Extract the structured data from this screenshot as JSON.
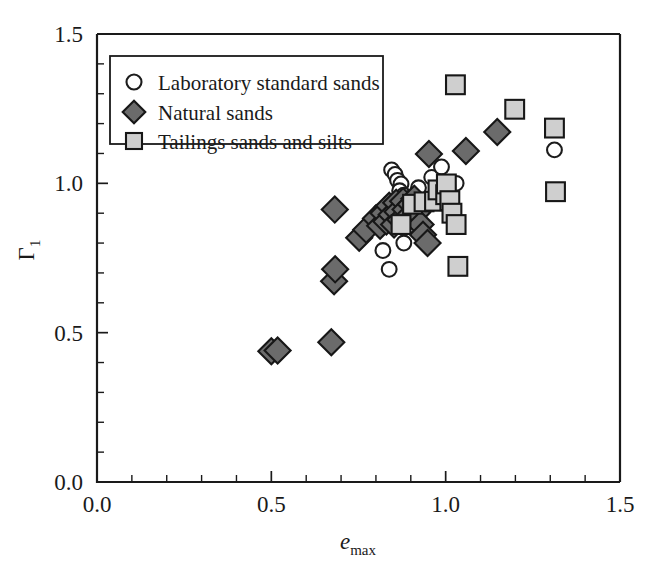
{
  "chart_data": {
    "type": "scatter",
    "title": "",
    "xlabel": "e_max",
    "xlabel_base": "e",
    "xlabel_sub": "max",
    "ylabel": "Γ₁",
    "ylabel_base": "Γ",
    "ylabel_sub": "1",
    "xlim": [
      0.0,
      1.5
    ],
    "ylim": [
      0.0,
      1.5
    ],
    "xticks": [
      "0.0",
      "0.5",
      "1.0",
      "1.5"
    ],
    "xtick_values": [
      0.0,
      0.5,
      1.0,
      1.5
    ],
    "yticks": [
      "0.0",
      "0.5",
      "1.0",
      "1.5"
    ],
    "ytick_values": [
      0.0,
      0.5,
      1.0,
      1.5
    ],
    "minor_tick_step": 0.1,
    "grid": false,
    "legend_position": "upper-left-inside",
    "series": [
      {
        "name": "Laboratory standard sands",
        "marker": "circle",
        "marker_fill": "#ffffff",
        "marker_edge": "#1c1c1c",
        "points": [
          [
            0.845,
            1.045
          ],
          [
            0.855,
            1.03
          ],
          [
            0.862,
            1.01
          ],
          [
            0.872,
            0.998
          ],
          [
            0.868,
            0.975
          ],
          [
            0.88,
            0.96
          ],
          [
            0.84,
            0.935
          ],
          [
            0.833,
            0.92
          ],
          [
            0.885,
            0.945
          ],
          [
            0.812,
            0.905
          ],
          [
            0.905,
            0.955
          ],
          [
            0.922,
            0.985
          ],
          [
            0.96,
            1.02
          ],
          [
            0.988,
            1.055
          ],
          [
            1.018,
            0.995
          ],
          [
            1.03,
            1.0
          ],
          [
            0.82,
            0.775
          ],
          [
            0.838,
            0.712
          ],
          [
            0.88,
            0.8
          ],
          [
            0.908,
            0.86
          ],
          [
            1.312,
            1.112
          ]
        ]
      },
      {
        "name": "Natural sands",
        "marker": "diamond",
        "marker_fill": "#6b6b6b",
        "marker_edge": "#171717",
        "points": [
          [
            0.5,
            0.438
          ],
          [
            0.518,
            0.44
          ],
          [
            0.672,
            0.468
          ],
          [
            0.68,
            0.672
          ],
          [
            0.683,
            0.712
          ],
          [
            0.682,
            0.912
          ],
          [
            0.752,
            0.818
          ],
          [
            0.772,
            0.845
          ],
          [
            0.8,
            0.882
          ],
          [
            0.812,
            0.858
          ],
          [
            0.822,
            0.9
          ],
          [
            0.83,
            0.872
          ],
          [
            0.838,
            0.925
          ],
          [
            0.845,
            0.895
          ],
          [
            0.852,
            0.862
          ],
          [
            0.858,
            0.935
          ],
          [
            0.862,
            0.905
          ],
          [
            0.87,
            0.878
          ],
          [
            0.878,
            0.94
          ],
          [
            0.885,
            0.912
          ],
          [
            0.892,
            0.888
          ],
          [
            0.9,
            0.93
          ],
          [
            0.91,
            0.948
          ],
          [
            0.918,
            0.902
          ],
          [
            0.928,
            0.862
          ],
          [
            0.935,
            0.828
          ],
          [
            0.948,
            0.8
          ],
          [
            0.952,
            1.098
          ],
          [
            1.058,
            1.108
          ],
          [
            1.148,
            1.172
          ]
        ]
      },
      {
        "name": "Tailings sands and silts",
        "marker": "square",
        "marker_fill": "#cfcfcf",
        "marker_edge": "#171717",
        "points": [
          [
            0.872,
            0.862
          ],
          [
            0.905,
            0.93
          ],
          [
            0.938,
            0.938
          ],
          [
            0.968,
            0.94
          ],
          [
            0.978,
            0.978
          ],
          [
            1.0,
            0.962
          ],
          [
            1.002,
            0.998
          ],
          [
            1.012,
            0.942
          ],
          [
            1.018,
            0.9
          ],
          [
            1.03,
            0.862
          ],
          [
            1.028,
            1.33
          ],
          [
            1.035,
            0.722
          ],
          [
            1.198,
            1.248
          ],
          [
            1.312,
            1.185
          ],
          [
            1.315,
            0.972
          ]
        ]
      }
    ]
  },
  "legend": {
    "items": [
      {
        "label": "Laboratory standard sands",
        "marker": "circle-marker"
      },
      {
        "label": "Natural sands",
        "marker": "diamond-marker"
      },
      {
        "label": "Tailings sands and silts",
        "marker": "square-marker"
      }
    ]
  }
}
